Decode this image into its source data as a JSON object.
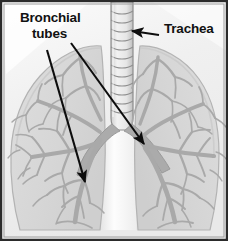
{
  "figure": {
    "type": "anatomical-illustration",
    "width": 228,
    "height": 241
  },
  "labels": {
    "bronchial_line1": "Bronchial",
    "bronchial_line2": "tubes",
    "trachea": "Trachea"
  },
  "colors": {
    "background": "#f4f4f4",
    "frame": "#2b2b2b",
    "lung_fill": "#d9d9d9",
    "lung_fill_light": "#e4e4e4",
    "lung_outline": "#b2b2b2",
    "bronchi": "#a9a9a9",
    "bronchi_dark": "#9a9a9a",
    "trachea_fill": "#e8e8e8",
    "trachea_outline": "#8f8f8f",
    "mediastinum": "#fbfbfb",
    "arrow": "#0d0d0d",
    "text": "#111111"
  },
  "parts": {
    "trachea": "trachea",
    "left_lung": "left-lung",
    "right_lung": "right-lung",
    "left_bronchial_tree": "left-bronchial-tree",
    "right_bronchial_tree": "right-bronchial-tree",
    "carina": "carina",
    "mediastinum": "mediastinum"
  },
  "annotations": [
    {
      "name": "arrow-bronchial-left",
      "target": "left primary bronchus / lower lobe",
      "from": [
        47,
        50
      ],
      "to": [
        86,
        185
      ]
    },
    {
      "name": "arrow-bronchial-right",
      "target": "right primary bronchus",
      "from": [
        71,
        43
      ],
      "to": [
        146,
        146
      ]
    },
    {
      "name": "arrow-trachea",
      "target": "trachea cartilage rings",
      "from": [
        158,
        34
      ],
      "to": [
        131,
        32
      ]
    }
  ],
  "trachea_rings": 13
}
